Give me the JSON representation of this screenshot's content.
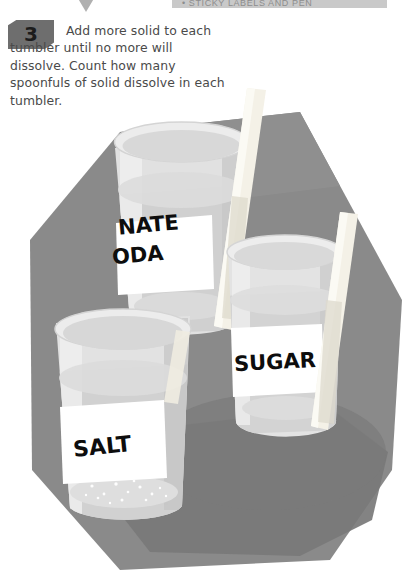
{
  "page": {
    "width": 404,
    "height": 573,
    "background_color": "#ffffff"
  },
  "top_banner": {
    "text": "• STICKY LABELS AND PEN",
    "background_color": "#c9c9c9",
    "text_color": "#8d8d8d"
  },
  "marker": {
    "shape": "down-triangle",
    "color": "#b0b0b0"
  },
  "step": {
    "number": "3",
    "badge_color": "#6e6e6e",
    "text": "Add more solid to each tumbler until no more will dissolve. Count how many spoonfuls of solid dissolve in each tumbler.",
    "text_color": "#4a4a4a"
  },
  "illustration": {
    "description": "Three glass tumblers of water with wooden stirring sticks on a gray surface",
    "surface_color": "#8a8a8a",
    "shadow_color": "#7a7a7a",
    "glass_color": "#e4e4e4",
    "water_color": "#d2d2d2",
    "stick_color": "#f2efe6",
    "label_paper_color": "#ffffff",
    "tumblers": [
      {
        "name": "bicarbonate-soda-tumbler",
        "label_line_1": "NATE",
        "label_line_2": "ODA",
        "full_label": "BICARBONATE SODA",
        "position": "back-left"
      },
      {
        "name": "sugar-tumbler",
        "label_line_1": "SUGAR",
        "full_label": "SUGAR",
        "position": "right"
      },
      {
        "name": "salt-tumbler",
        "label_line_1": "SALT",
        "full_label": "SALT",
        "position": "front-left"
      }
    ]
  }
}
